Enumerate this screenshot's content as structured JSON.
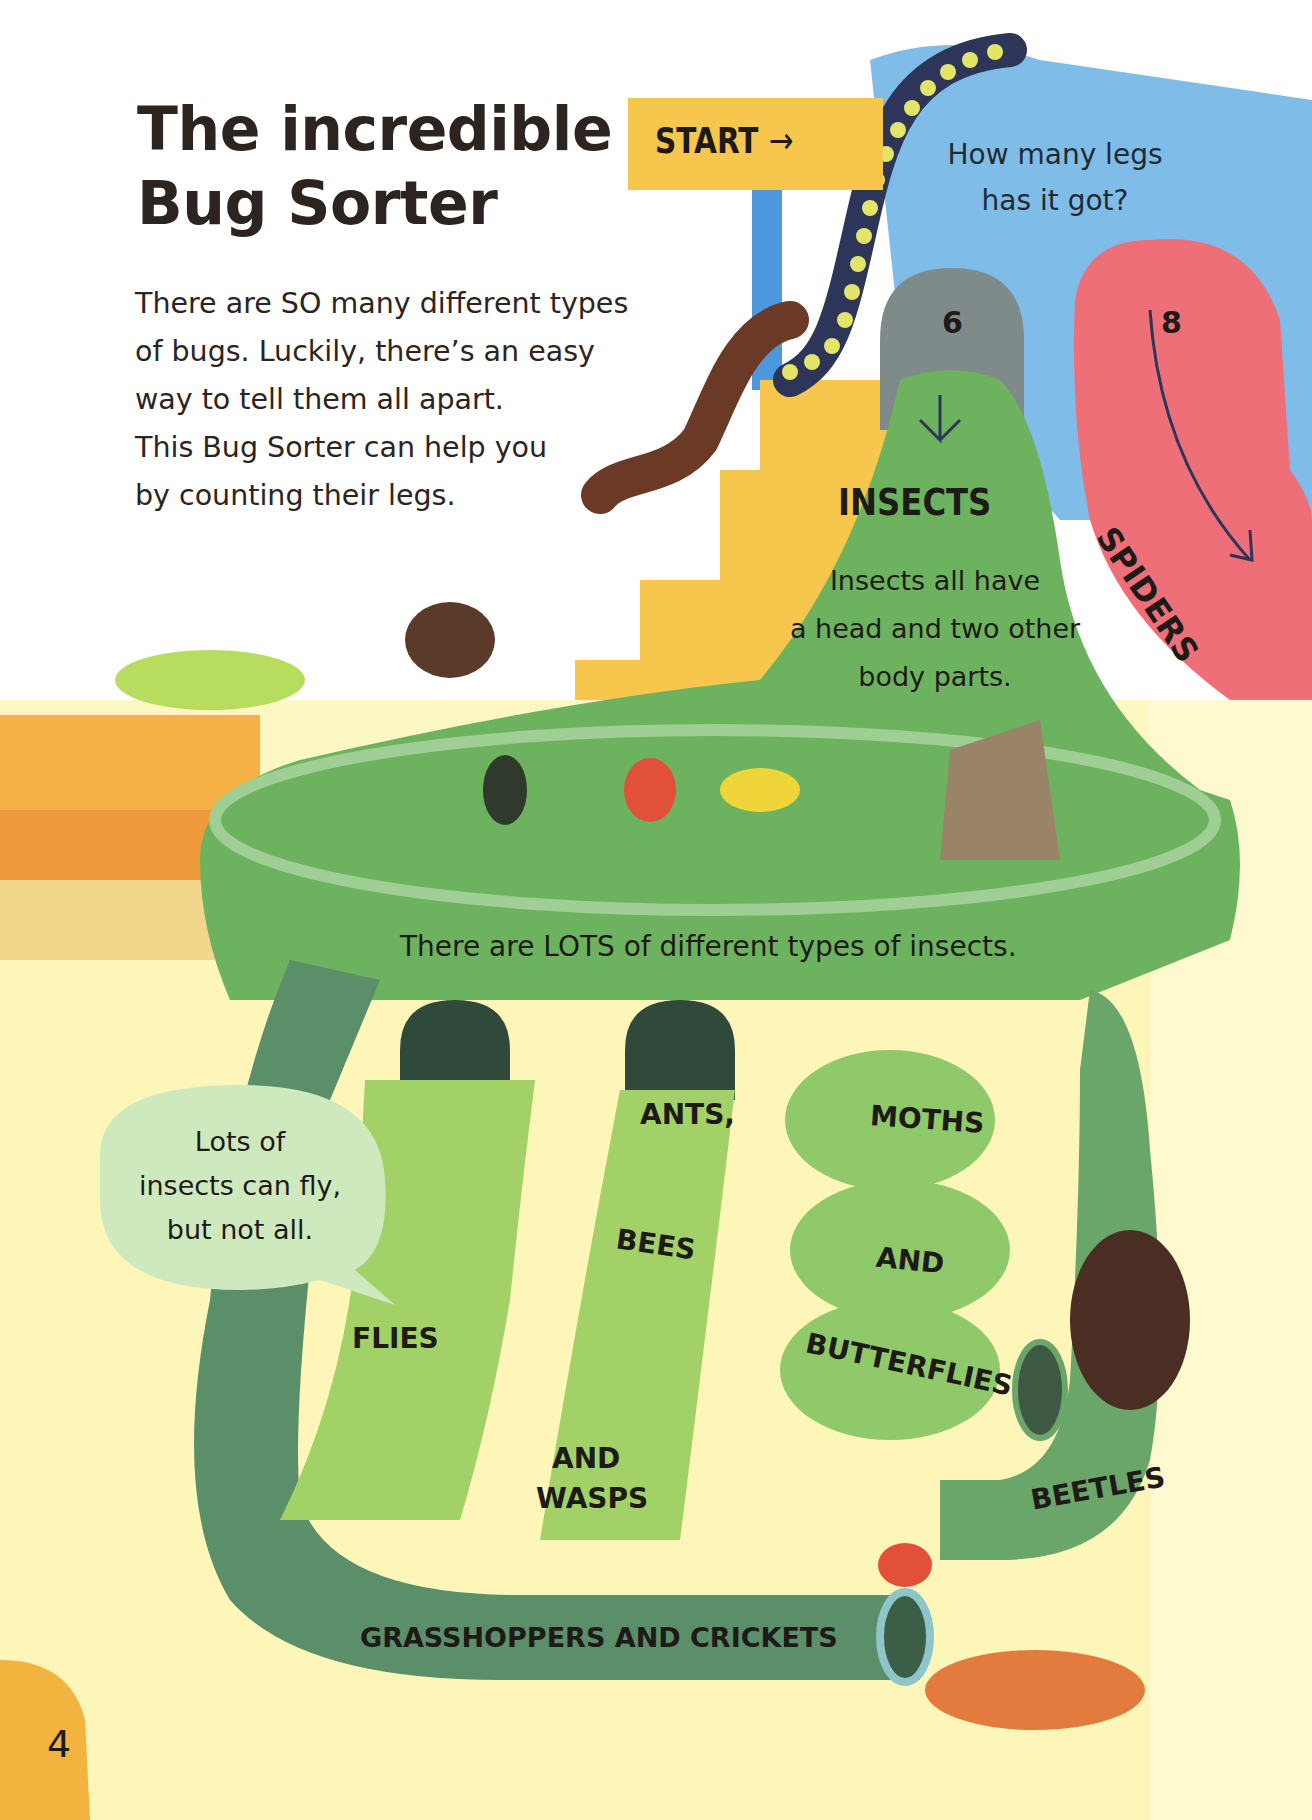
{
  "page": {
    "title_lines": [
      "The incredible",
      "Bug Sorter"
    ],
    "intro_lines": [
      "There are SO many different types",
      "of bugs. Luckily, there’s an easy",
      "way to tell them all apart.",
      "This Bug Sorter can help you",
      "by counting their legs."
    ],
    "page_number": "4"
  },
  "sorter": {
    "start_label": "START",
    "start_arrow": "→",
    "question_lines": [
      "How many legs",
      "has it got?"
    ],
    "branches": [
      {
        "legs": "6",
        "label": "INSECTS",
        "color": "#6db35f"
      },
      {
        "legs": "8",
        "label": "SPIDERS",
        "color": "#ee6f78"
      }
    ],
    "insects_description_lines": [
      "Insects all have",
      "a head and two other",
      "body parts."
    ],
    "insects_note": "There are LOTS of different types of insects.",
    "speech_bubble_lines": [
      "Lots of",
      "insects can fly,",
      "but not all."
    ],
    "categories": {
      "flies": "FLIES",
      "ants": "ANTS,",
      "bees": "BEES",
      "and_wasps_1": "AND",
      "and_wasps_2": "WASPS",
      "moths": "MOTHS",
      "and": "AND",
      "butterflies": "BUTTERFLIES",
      "beetles": "BEETLES",
      "grasshoppers": "GRASSHOPPERS AND CRICKETS"
    }
  },
  "colors": {
    "blue_slide": "#7fbde8",
    "pink_slide": "#ee6f78",
    "green_main": "#6db35f",
    "green_light": "#9fd67a",
    "green_dark": "#5a8f6a",
    "sign_yellow": "#f7c64c",
    "floor_orange": "#f3a23f",
    "floor_yellow": "#fdf5b3"
  }
}
